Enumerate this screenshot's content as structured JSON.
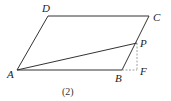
{
  "diagram": {
    "type": "parallelogram-geometry",
    "caption": "(2)",
    "colors": {
      "line": "#333333",
      "dashed": "#888888",
      "background": "#ffffff"
    },
    "points": {
      "A": {
        "label": "A",
        "x": 17,
        "y": 70
      },
      "B": {
        "label": "B",
        "x": 122,
        "y": 70
      },
      "C": {
        "label": "C",
        "x": 149,
        "y": 16
      },
      "D": {
        "label": "D",
        "x": 48,
        "y": 16
      },
      "P": {
        "label": "P",
        "x": 137,
        "y": 43
      },
      "F": {
        "label": "F",
        "x": 138,
        "y": 70
      }
    },
    "segments": [
      {
        "from": "A",
        "to": "B",
        "style": "solid"
      },
      {
        "from": "B",
        "to": "C",
        "style": "solid"
      },
      {
        "from": "C",
        "to": "D",
        "style": "solid"
      },
      {
        "from": "D",
        "to": "A",
        "style": "solid"
      },
      {
        "from": "A",
        "to": "P",
        "style": "solid"
      },
      {
        "from": "P",
        "to": "F",
        "style": "dashed"
      },
      {
        "from": "B",
        "to": "F",
        "style": "dashed"
      }
    ]
  }
}
